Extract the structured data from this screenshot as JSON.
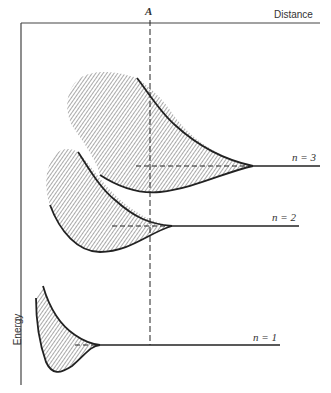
{
  "diagram": {
    "x_axis_label": "Distance",
    "y_axis_label": "Energy",
    "marker_label": "A",
    "levels": [
      {
        "label": "n = 3"
      },
      {
        "label": "n = 2"
      },
      {
        "label": "n = 1"
      }
    ],
    "colors": {
      "line": "#222222",
      "hatch": "#555555",
      "text": "#333333"
    }
  }
}
